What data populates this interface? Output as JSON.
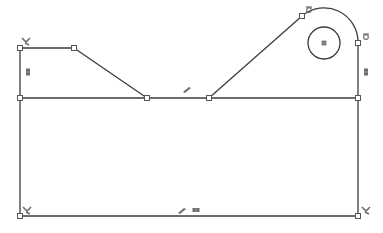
{
  "sketch": {
    "title": "Sketch profile",
    "colors": {
      "line": "#3c3c3c",
      "point_fill": "#ffffff",
      "point_stroke": "#555555",
      "relation": "#6e6e6e",
      "background": "#ffffff"
    },
    "points": [
      {
        "id": "p1",
        "x": 20,
        "y": 48
      },
      {
        "id": "p2",
        "x": 74,
        "y": 48
      },
      {
        "id": "p3",
        "x": 147,
        "y": 98
      },
      {
        "id": "p4",
        "x": 209,
        "y": 98
      },
      {
        "id": "p5",
        "x": 302,
        "y": 16
      },
      {
        "id": "p6",
        "x": 358,
        "y": 43
      },
      {
        "id": "p7",
        "x": 358,
        "y": 98
      },
      {
        "id": "p8",
        "x": 20,
        "y": 98
      },
      {
        "id": "p9",
        "x": 20,
        "y": 216
      },
      {
        "id": "p10",
        "x": 358,
        "y": 216
      }
    ],
    "lines": [
      {
        "id": "l-top-left",
        "x1": 20,
        "y1": 48,
        "x2": 74,
        "y2": 48
      },
      {
        "id": "l-diag-left",
        "x1": 74,
        "y1": 48,
        "x2": 147,
        "y2": 98
      },
      {
        "id": "l-diag-right",
        "x1": 209,
        "y1": 98,
        "x2": 302,
        "y2": 16
      },
      {
        "id": "l-right-upper",
        "x1": 358,
        "y1": 43,
        "x2": 358,
        "y2": 98
      },
      {
        "id": "l-middle",
        "x1": 20,
        "y1": 98,
        "x2": 358,
        "y2": 98
      },
      {
        "id": "l-left-upper",
        "x1": 20,
        "y1": 48,
        "x2": 20,
        "y2": 98
      },
      {
        "id": "l-left-lower",
        "x1": 20,
        "y1": 98,
        "x2": 20,
        "y2": 216
      },
      {
        "id": "l-right-lower",
        "x1": 358,
        "y1": 98,
        "x2": 358,
        "y2": 216
      },
      {
        "id": "l-bottom",
        "x1": 20,
        "y1": 216,
        "x2": 358,
        "y2": 216
      }
    ],
    "arc": {
      "id": "a-top-right",
      "x1": 302,
      "y1": 16,
      "x2": 358,
      "y2": 43,
      "r": 34
    },
    "circle": {
      "id": "c-hole",
      "cx": 324,
      "cy": 43,
      "r": 16
    },
    "relations": [
      {
        "type": "coincident",
        "x": 26,
        "y": 41
      },
      {
        "type": "vertical",
        "x": 28,
        "y": 72
      },
      {
        "type": "tangent",
        "x": 309,
        "y": 10
      },
      {
        "type": "tangent",
        "x": 366,
        "y": 37
      },
      {
        "type": "vertical",
        "x": 366,
        "y": 72
      },
      {
        "type": "parallel",
        "x": 187,
        "y": 90
      },
      {
        "type": "coincident",
        "x": 27,
        "y": 210
      },
      {
        "type": "parallel",
        "x": 182,
        "y": 211
      },
      {
        "type": "horizontal",
        "x": 196,
        "y": 210
      },
      {
        "type": "coincident",
        "x": 366,
        "y": 210
      }
    ]
  }
}
